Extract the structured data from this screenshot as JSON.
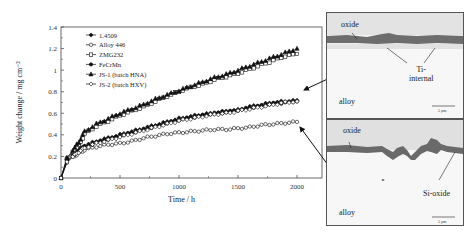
{
  "chart_data": {
    "type": "line",
    "title": "",
    "xlabel": "Time / h",
    "ylabel": "Weight change / mg cm⁻²",
    "xlim": [
      0,
      2200
    ],
    "ylim": [
      0,
      1.4
    ],
    "xticks": [
      0,
      500,
      1000,
      1500,
      2000
    ],
    "yticks": [
      0,
      0.2,
      0.4,
      0.6,
      0.8,
      1,
      1.2,
      1.4
    ],
    "grid": false,
    "legend_position": "upper left",
    "x": [
      0,
      50,
      100,
      150,
      200,
      300,
      400,
      500,
      600,
      700,
      800,
      900,
      1000,
      1100,
      1200,
      1300,
      1400,
      1500,
      1600,
      1700,
      1800,
      1900,
      2000
    ],
    "series": [
      {
        "name": "1.4509",
        "marker": "filled-diamond",
        "values": [
          0,
          0.17,
          0.22,
          0.26,
          0.3,
          0.34,
          0.37,
          0.4,
          0.43,
          0.46,
          0.49,
          0.52,
          0.55,
          0.57,
          0.59,
          0.6,
          0.62,
          0.63,
          0.66,
          0.68,
          0.7,
          0.71,
          0.72
        ]
      },
      {
        "name": "Alloy 446",
        "marker": "open-circle",
        "values": [
          0,
          0.14,
          0.19,
          0.23,
          0.26,
          0.29,
          0.31,
          0.32,
          0.34,
          0.37,
          0.39,
          0.41,
          0.42,
          0.43,
          0.44,
          0.45,
          0.45,
          0.46,
          0.47,
          0.49,
          0.5,
          0.51,
          0.52
        ]
      },
      {
        "name": "ZMG232",
        "marker": "open-square",
        "values": [
          0,
          0.18,
          0.24,
          0.3,
          0.41,
          0.48,
          0.53,
          0.58,
          0.62,
          0.66,
          0.71,
          0.76,
          0.8,
          0.84,
          0.87,
          0.91,
          0.94,
          0.97,
          1.01,
          1.05,
          1.09,
          1.13,
          1.15
        ]
      },
      {
        "name": "FeCrMn",
        "marker": "filled-circle",
        "values": [
          0,
          0.16,
          0.21,
          0.25,
          0.29,
          0.33,
          0.36,
          0.39,
          0.42,
          0.45,
          0.48,
          0.51,
          0.54,
          0.56,
          0.58,
          0.6,
          0.61,
          0.63,
          0.65,
          0.67,
          0.69,
          0.7,
          0.71
        ]
      },
      {
        "name": "JS-1 (batch HNA)",
        "marker": "filled-triangle",
        "values": [
          0,
          0.19,
          0.26,
          0.33,
          0.43,
          0.5,
          0.55,
          0.6,
          0.64,
          0.68,
          0.73,
          0.77,
          0.81,
          0.85,
          0.89,
          0.93,
          0.96,
          1.0,
          1.04,
          1.08,
          1.12,
          1.16,
          1.2
        ]
      },
      {
        "name": "JS-2 (batch HXV)",
        "marker": "open-diamond",
        "values": [
          0,
          0.15,
          0.2,
          0.24,
          0.28,
          0.32,
          0.35,
          0.38,
          0.41,
          0.44,
          0.47,
          0.5,
          0.53,
          0.55,
          0.57,
          0.59,
          0.6,
          0.62,
          0.64,
          0.66,
          0.68,
          0.7,
          0.71
        ]
      }
    ],
    "annotations": [
      {
        "text": "arrow from upper micrograph to middle curve group at ~2000 h"
      },
      {
        "text": "arrow from lower micrograph to Alloy 446 curve at ~2000 h"
      }
    ]
  },
  "micrographs": [
    {
      "labels": {
        "oxide": "oxide",
        "internal": "Ti-\ninternal",
        "alloy": "alloy"
      },
      "scale_bar": "5 µm"
    },
    {
      "labels": {
        "oxide": "oxide",
        "internal": "Si-oxide",
        "alloy": "alloy"
      },
      "scale_bar": "5 µm"
    }
  ]
}
